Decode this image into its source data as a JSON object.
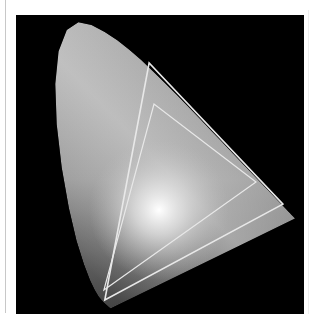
{
  "figure": {
    "type": "cie-chromaticity-diagram",
    "rendering": "grayscale",
    "background_color": "#000000",
    "locus_color": "#9a9a9a",
    "gamut_line_color": "#e8e8e8",
    "white_point": {
      "x": 0.32,
      "y": 0.29
    },
    "spectral_locus": [
      [
        0.1741,
        0.005
      ],
      [
        0.1738,
        0.0049
      ],
      [
        0.1736,
        0.0049
      ],
      [
        0.1733,
        0.0048
      ],
      [
        0.173,
        0.0048
      ],
      [
        0.1726,
        0.0048
      ],
      [
        0.1721,
        0.0048
      ],
      [
        0.1714,
        0.0051
      ],
      [
        0.1703,
        0.0058
      ],
      [
        0.1689,
        0.0069
      ],
      [
        0.1669,
        0.0086
      ],
      [
        0.1644,
        0.0109
      ],
      [
        0.1611,
        0.0138
      ],
      [
        0.1566,
        0.0177
      ],
      [
        0.151,
        0.0227
      ],
      [
        0.144,
        0.0297
      ],
      [
        0.1355,
        0.0399
      ],
      [
        0.1241,
        0.0578
      ],
      [
        0.1096,
        0.0868
      ],
      [
        0.0913,
        0.1327
      ],
      [
        0.0687,
        0.2007
      ],
      [
        0.0454,
        0.295
      ],
      [
        0.0235,
        0.4127
      ],
      [
        0.0082,
        0.5384
      ],
      [
        0.0039,
        0.6548
      ],
      [
        0.0139,
        0.7502
      ],
      [
        0.0389,
        0.812
      ],
      [
        0.0743,
        0.8338
      ],
      [
        0.1142,
        0.8262
      ],
      [
        0.1547,
        0.8059
      ],
      [
        0.1929,
        0.7816
      ],
      [
        0.2296,
        0.7543
      ],
      [
        0.2658,
        0.7243
      ],
      [
        0.3016,
        0.6923
      ],
      [
        0.3373,
        0.6589
      ],
      [
        0.3731,
        0.6245
      ],
      [
        0.4087,
        0.5896
      ],
      [
        0.4441,
        0.5547
      ],
      [
        0.4788,
        0.5202
      ],
      [
        0.5125,
        0.4866
      ],
      [
        0.5448,
        0.4544
      ],
      [
        0.5752,
        0.4242
      ],
      [
        0.6029,
        0.3965
      ],
      [
        0.627,
        0.3725
      ],
      [
        0.6482,
        0.3514
      ],
      [
        0.6658,
        0.334
      ],
      [
        0.6801,
        0.3197
      ],
      [
        0.6915,
        0.3083
      ],
      [
        0.7006,
        0.2993
      ],
      [
        0.7079,
        0.292
      ],
      [
        0.714,
        0.2859
      ],
      [
        0.719,
        0.2809
      ],
      [
        0.723,
        0.277
      ],
      [
        0.726,
        0.274
      ],
      [
        0.7283,
        0.2717
      ],
      [
        0.73,
        0.27
      ],
      [
        0.7311,
        0.2689
      ],
      [
        0.732,
        0.268
      ],
      [
        0.7327,
        0.2673
      ],
      [
        0.7334,
        0.2666
      ],
      [
        0.734,
        0.266
      ],
      [
        0.7344,
        0.2656
      ],
      [
        0.7346,
        0.2654
      ],
      [
        0.7347,
        0.2653
      ]
    ],
    "gamuts": [
      {
        "name": "outer-gamut",
        "vertices": {
          "red": [
            0.698,
            0.307
          ],
          "green": [
            0.29,
            0.716
          ],
          "blue": [
            0.155,
            0.029
          ]
        }
      },
      {
        "name": "inner-gamut",
        "vertices": {
          "red": [
            0.616,
            0.371
          ],
          "green": [
            0.305,
            0.597
          ],
          "blue": [
            0.152,
            0.058
          ]
        }
      }
    ]
  }
}
